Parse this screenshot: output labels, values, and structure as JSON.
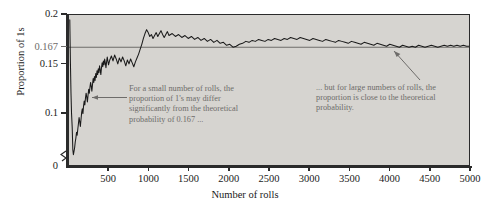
{
  "chart_data": {
    "type": "line",
    "title": "",
    "xlabel": "Number of rolls",
    "ylabel": "Proportion of 1s",
    "xlim": [
      0,
      5000
    ],
    "ylim": [
      0.045,
      0.2
    ],
    "grid": false,
    "legend": null,
    "background_color": "#d6d4d0",
    "line_color": "#1a1a1a",
    "reference_line": {
      "value": 0.167,
      "label": "0.167",
      "color": "#6e6c6a",
      "orientation": "horizontal"
    },
    "y_ticks": [
      {
        "value": 0.2,
        "label": "0.2"
      },
      {
        "value": 0.167,
        "label": "0.167"
      },
      {
        "value": 0.15,
        "label": "0.15"
      },
      {
        "value": 0.1,
        "label": "0.1"
      },
      {
        "value": 0.0,
        "label": "0"
      }
    ],
    "x_ticks": [
      {
        "value": 500,
        "label": "500"
      },
      {
        "value": 1000,
        "label": "1000"
      },
      {
        "value": 1500,
        "label": "1500"
      },
      {
        "value": 2000,
        "label": "2000"
      },
      {
        "value": 2500,
        "label": "2500"
      },
      {
        "value": 3000,
        "label": "3000"
      },
      {
        "value": 3500,
        "label": "3500"
      },
      {
        "value": 4000,
        "label": "4000"
      },
      {
        "value": 4500,
        "label": "4500"
      },
      {
        "value": 5000,
        "label": "5000"
      }
    ],
    "axis_break": {
      "axis": "y",
      "between": [
        0.0,
        0.045
      ]
    },
    "series": [
      {
        "name": "Cumulative proportion of 1s",
        "x": [
          10,
          18,
          25,
          32,
          40,
          48,
          55,
          62,
          70,
          78,
          86,
          94,
          102,
          110,
          118,
          126,
          134,
          142,
          150,
          158,
          166,
          174,
          182,
          190,
          198,
          206,
          214,
          222,
          230,
          238,
          246,
          254,
          262,
          270,
          278,
          286,
          294,
          302,
          310,
          318,
          326,
          334,
          342,
          350,
          358,
          366,
          374,
          382,
          390,
          398,
          406,
          414,
          422,
          430,
          438,
          446,
          454,
          462,
          470,
          478,
          486,
          494,
          510,
          530,
          550,
          570,
          590,
          610,
          630,
          650,
          670,
          690,
          710,
          730,
          750,
          770,
          790,
          810,
          830,
          850,
          870,
          890,
          910,
          930,
          950,
          970,
          990,
          1010,
          1030,
          1050,
          1070,
          1090,
          1110,
          1130,
          1150,
          1170,
          1190,
          1210,
          1230,
          1250,
          1290,
          1330,
          1370,
          1410,
          1450,
          1490,
          1530,
          1570,
          1610,
          1650,
          1690,
          1730,
          1770,
          1810,
          1850,
          1890,
          1930,
          1970,
          2010,
          2050,
          2090,
          2130,
          2170,
          2210,
          2250,
          2290,
          2330,
          2370,
          2410,
          2450,
          2490,
          2530,
          2570,
          2610,
          2650,
          2690,
          2730,
          2770,
          2810,
          2850,
          2890,
          2930,
          2970,
          3010,
          3050,
          3090,
          3130,
          3170,
          3210,
          3250,
          3290,
          3330,
          3370,
          3410,
          3450,
          3490,
          3530,
          3570,
          3610,
          3650,
          3690,
          3730,
          3770,
          3810,
          3850,
          3890,
          3930,
          3970,
          4010,
          4050,
          4090,
          4130,
          4170,
          4210,
          4250,
          4290,
          4330,
          4370,
          4410,
          4450,
          4490,
          4530,
          4570,
          4610,
          4650,
          4690,
          4730,
          4770,
          4810,
          4850,
          4890,
          4930,
          4970,
          5000
        ],
        "y": [
          0.195,
          0.15,
          0.12,
          0.099,
          0.085,
          0.062,
          0.057,
          0.06,
          0.064,
          0.07,
          0.074,
          0.08,
          0.077,
          0.083,
          0.089,
          0.095,
          0.091,
          0.086,
          0.093,
          0.1,
          0.104,
          0.099,
          0.107,
          0.112,
          0.108,
          0.115,
          0.12,
          0.116,
          0.111,
          0.118,
          0.124,
          0.12,
          0.126,
          0.131,
          0.127,
          0.122,
          0.129,
          0.135,
          0.131,
          0.137,
          0.133,
          0.14,
          0.136,
          0.143,
          0.139,
          0.145,
          0.141,
          0.148,
          0.144,
          0.139,
          0.146,
          0.151,
          0.147,
          0.153,
          0.149,
          0.155,
          0.151,
          0.146,
          0.152,
          0.157,
          0.153,
          0.149,
          0.154,
          0.158,
          0.153,
          0.159,
          0.155,
          0.15,
          0.156,
          0.152,
          0.157,
          0.153,
          0.148,
          0.154,
          0.15,
          0.155,
          0.151,
          0.147,
          0.152,
          0.156,
          0.16,
          0.165,
          0.17,
          0.176,
          0.181,
          0.185,
          0.182,
          0.178,
          0.18,
          0.176,
          0.179,
          0.182,
          0.178,
          0.181,
          0.184,
          0.18,
          0.177,
          0.18,
          0.183,
          0.179,
          0.181,
          0.178,
          0.18,
          0.177,
          0.179,
          0.176,
          0.178,
          0.175,
          0.177,
          0.174,
          0.176,
          0.173,
          0.175,
          0.172,
          0.174,
          0.171,
          0.172,
          0.169,
          0.17,
          0.167,
          0.168,
          0.17,
          0.171,
          0.173,
          0.172,
          0.174,
          0.173,
          0.175,
          0.174,
          0.173,
          0.175,
          0.174,
          0.176,
          0.175,
          0.174,
          0.176,
          0.175,
          0.177,
          0.176,
          0.175,
          0.177,
          0.176,
          0.175,
          0.174,
          0.176,
          0.175,
          0.174,
          0.173,
          0.175,
          0.174,
          0.173,
          0.172,
          0.174,
          0.173,
          0.172,
          0.171,
          0.173,
          0.172,
          0.171,
          0.17,
          0.172,
          0.171,
          0.17,
          0.169,
          0.171,
          0.17,
          0.169,
          0.168,
          0.17,
          0.169,
          0.168,
          0.167,
          0.169,
          0.168,
          0.167,
          0.168,
          0.167,
          0.169,
          0.168,
          0.167,
          0.168,
          0.169,
          0.168,
          0.167,
          0.168,
          0.169,
          0.168,
          0.169,
          0.168,
          0.169,
          0.168,
          0.169,
          0.168,
          0.168
        ]
      }
    ],
    "annotations": [
      {
        "id": "small-n",
        "text": "For a small number of rolls, the proportion of 1's may differ significantly from the theoretical probability of 0.167 ...",
        "arrow": "points-left-to-curve",
        "color": "#6e6c6a"
      },
      {
        "id": "large-n",
        "text": "... but for large numbers of rolls, the proportion is close to the theoretical probability.",
        "arrow": "points-up-left-to-curve",
        "color": "#6e6c6a"
      }
    ]
  }
}
